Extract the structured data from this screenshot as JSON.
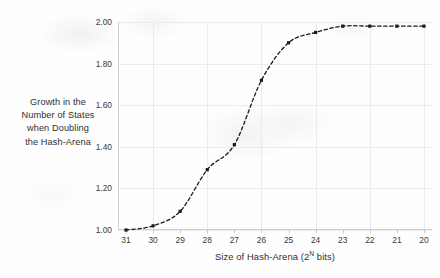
{
  "chart_data": {
    "type": "line",
    "title": "",
    "xlabel": "Size of Hash-Arena (2^N bits)",
    "xlabel_prefix": "Size of Hash-Arena (2",
    "xlabel_exponent": "N",
    "xlabel_suffix": " bits)",
    "ylabel_lines": [
      "Growth in the",
      "Number of States",
      "when Doubling",
      "the Hash-Arena"
    ],
    "categories": [
      31,
      30,
      29,
      28,
      27,
      26,
      25,
      24,
      23,
      22,
      21,
      20
    ],
    "xtick_labels": [
      "31",
      "30",
      "29",
      "28",
      "27",
      "26",
      "25",
      "24",
      "23",
      "22",
      "21",
      "20"
    ],
    "values": [
      1.0,
      1.02,
      1.09,
      1.29,
      1.41,
      1.72,
      1.9,
      1.95,
      1.98,
      1.98,
      1.98,
      1.98
    ],
    "ylim": [
      1.0,
      2.0
    ],
    "yticks": [
      1.0,
      1.2,
      1.4,
      1.6,
      1.8,
      2.0
    ],
    "ytick_labels": [
      "1.00",
      "1.20",
      "1.40",
      "1.60",
      "1.80",
      "2.00"
    ],
    "grid": true,
    "legend": "none",
    "line_style": "dashed",
    "marker": "square",
    "series_color": "#1a1a1a",
    "grid_color": "#ebebeb",
    "axis_color": "#cfcfcf",
    "background_color": "#fefefe"
  }
}
